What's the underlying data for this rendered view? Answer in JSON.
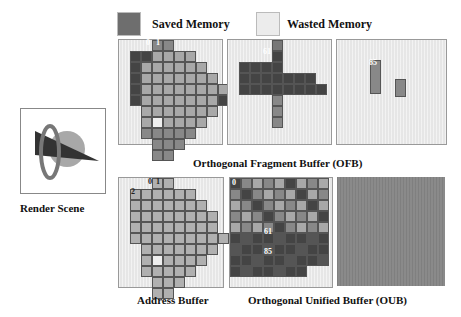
{
  "legend": {
    "saved": {
      "label": "Saved Memory",
      "color": "#777777"
    },
    "wasted": {
      "label": "Wasted Memory",
      "color": "#e8e8e8"
    }
  },
  "scene": {
    "label": "Render Scene"
  },
  "ofb": {
    "caption": "Orthogonal Fragment Buffer (OFB)",
    "panels": [
      {
        "labels": [
          "0",
          "1"
        ]
      },
      {
        "labels": [
          "61"
        ]
      },
      {
        "labels": [
          "85"
        ]
      }
    ]
  },
  "address_buffer": {
    "caption": "Address Buffer",
    "labels": [
      "0",
      "1",
      "2"
    ]
  },
  "oub": {
    "caption": "Orthogonal Unified Buffer (OUB)",
    "labels": [
      "0",
      "61",
      "85"
    ]
  },
  "colors": {
    "light_cell": "#a8a8a8",
    "mid_cell": "#888888",
    "dark_cell": "#444444",
    "panel_bg": "#e6e6e6",
    "oub_fill": "#8a8a8a"
  }
}
